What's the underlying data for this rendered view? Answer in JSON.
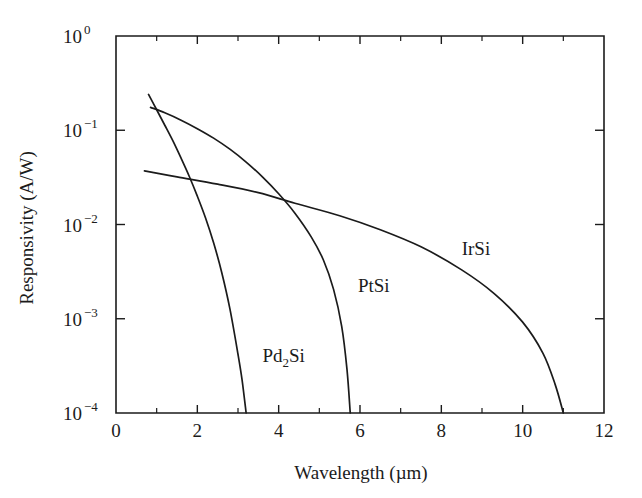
{
  "chart_data": {
    "type": "line",
    "title": "",
    "xlabel": "Wavelength (µm)",
    "ylabel": "Responsivity (A/W)",
    "xlim": [
      0,
      12
    ],
    "ylim": [
      0.0001,
      1
    ],
    "yscale": "log",
    "xscale": "linear",
    "grid": false,
    "legend": "inline-curve-labels",
    "x_ticks": [
      0,
      1,
      2,
      3,
      4,
      5,
      6,
      7,
      8,
      9,
      10,
      11,
      12
    ],
    "x_tick_labels": [
      "0",
      "",
      "2",
      "",
      "4",
      "",
      "6",
      "",
      "8",
      "",
      "10",
      "",
      "12"
    ],
    "x_major_ticks": [
      0,
      2,
      4,
      6,
      8,
      10,
      12
    ],
    "y_ticks": [
      1,
      0.1,
      0.01,
      0.001,
      0.0001
    ],
    "y_tick_labels": [
      "10⁰",
      "10⁻¹",
      "10⁻²",
      "10⁻³",
      "10⁻⁴"
    ],
    "y_tick_mantissa": [
      "10",
      "10",
      "10",
      "10",
      "10"
    ],
    "y_tick_exponents": [
      "0",
      "-1",
      "-2",
      "-3",
      "-4"
    ],
    "series": [
      {
        "name": "Pd2Si",
        "label_text": "Pd",
        "label_sub": "2",
        "label_tail": "Si",
        "label_x_um": 3.6,
        "label_y": 0.00035,
        "points": [
          [
            0.8,
            0.24
          ],
          [
            1.0,
            0.165
          ],
          [
            1.2,
            0.113
          ],
          [
            1.4,
            0.077
          ],
          [
            1.6,
            0.0505
          ],
          [
            1.8,
            0.0325
          ],
          [
            2.0,
            0.02
          ],
          [
            2.2,
            0.0118
          ],
          [
            2.4,
            0.0064
          ],
          [
            2.6,
            0.0031
          ],
          [
            2.8,
            0.00128
          ],
          [
            3.0,
            0.00042
          ],
          [
            3.1,
            0.000225
          ],
          [
            3.2,
            0.0001
          ]
        ]
      },
      {
        "name": "PtSi",
        "label_text": "PtSi",
        "label_x_um": 5.95,
        "label_y": 0.0019,
        "points": [
          [
            0.85,
            0.175
          ],
          [
            1.2,
            0.153
          ],
          [
            1.6,
            0.128
          ],
          [
            2.0,
            0.104
          ],
          [
            2.4,
            0.0825
          ],
          [
            2.8,
            0.063
          ],
          [
            3.2,
            0.046
          ],
          [
            3.6,
            0.032
          ],
          [
            4.0,
            0.0212
          ],
          [
            4.4,
            0.0132
          ],
          [
            4.8,
            0.0074
          ],
          [
            5.1,
            0.0042
          ],
          [
            5.35,
            0.00205
          ],
          [
            5.55,
            0.00083
          ],
          [
            5.68,
            0.00029
          ],
          [
            5.76,
            0.0001
          ]
        ]
      },
      {
        "name": "IrSi",
        "label_text": "IrSi",
        "label_x_um": 8.5,
        "label_y": 0.0048,
        "points": [
          [
            0.7,
            0.037
          ],
          [
            1.5,
            0.032
          ],
          [
            2.5,
            0.0268
          ],
          [
            3.5,
            0.0218
          ],
          [
            4.4,
            0.0168
          ],
          [
            5.5,
            0.0124
          ],
          [
            6.5,
            0.0088
          ],
          [
            7.5,
            0.0058
          ],
          [
            8.5,
            0.0033
          ],
          [
            9.3,
            0.00185
          ],
          [
            10.0,
            0.00092
          ],
          [
            10.5,
            0.00043
          ],
          [
            10.8,
            0.0002
          ],
          [
            11.0,
            0.0001
          ]
        ]
      }
    ]
  },
  "axes": {
    "x_title": "Wavelength (µm)",
    "y_title": "Responsivity (A/W)"
  },
  "style": {
    "ink": "#1b1b1b",
    "background": "#ffffff"
  }
}
